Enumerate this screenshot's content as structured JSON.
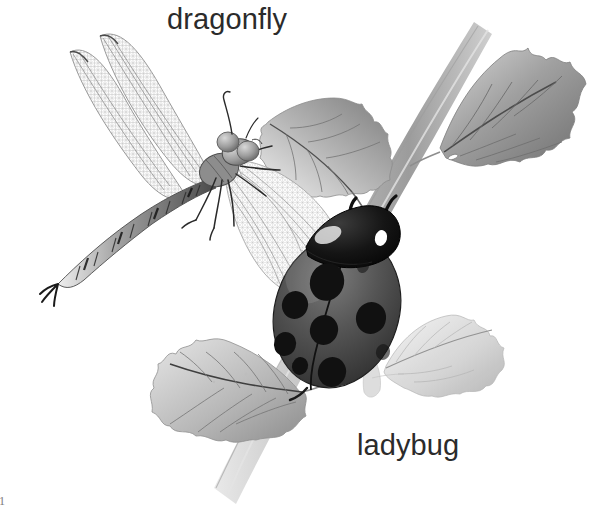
{
  "page": {
    "background_color": "#ffffff",
    "width": 595,
    "height": 514,
    "style": "grayscale pencil and watercolor natural-history illustration",
    "page_number": "1"
  },
  "labels": {
    "dragonfly": "dragonfly",
    "ladybug": "ladybug",
    "text_color": "#2b2b2b"
  },
  "subjects": [
    {
      "name": "dragonfly",
      "label": "dragonfly",
      "position": "upper-left",
      "description": "Dragonfly in flight with four long translucent net-veined wings, segmented banded abdomen curving to lower left, large compound eyes and six legs",
      "wings": 4,
      "colors": {
        "wing": "#f2f2f2",
        "vein": "#8a8a8a",
        "body": "#5a5a5a",
        "abdomen_band": "#3a3a3a"
      }
    },
    {
      "name": "ladybug",
      "label": "ladybug",
      "position": "center-right",
      "description": "Ladybug clinging head-up to the plant stem, domed oval elytra with black spots, black pronotum with two white marks, two curved antennae",
      "spot_count": 9,
      "colors": {
        "shell": "#4e4e4e",
        "shell_light": "#6d6d6d",
        "spot": "#141414",
        "head": "#1a1a1a",
        "highlight": "#ffffff"
      }
    }
  ],
  "plant": {
    "name": "stem with serrated leaves",
    "leaf_count": 4,
    "leaves": [
      {
        "id": "leaf-upper-right",
        "position": "upper-right",
        "tone": "#9a9a9a"
      },
      {
        "id": "leaf-upper-middle",
        "position": "upper-middle",
        "tone": "#a4a4a4"
      },
      {
        "id": "leaf-lower-left",
        "position": "lower-left",
        "tone": "#b0b0b0"
      },
      {
        "id": "leaf-lower-right",
        "position": "lower-right",
        "tone": "#c6c6c6"
      }
    ],
    "stem": {
      "id": "main-stem",
      "direction": "upper-right to lower-left",
      "tone": "#b8b8b8"
    }
  },
  "colors": {
    "background": "#ffffff",
    "ink": "#2b2b2b",
    "mid_gray": "#8a8a8a",
    "light_gray": "#cfcfcf",
    "dark": "#141414"
  }
}
